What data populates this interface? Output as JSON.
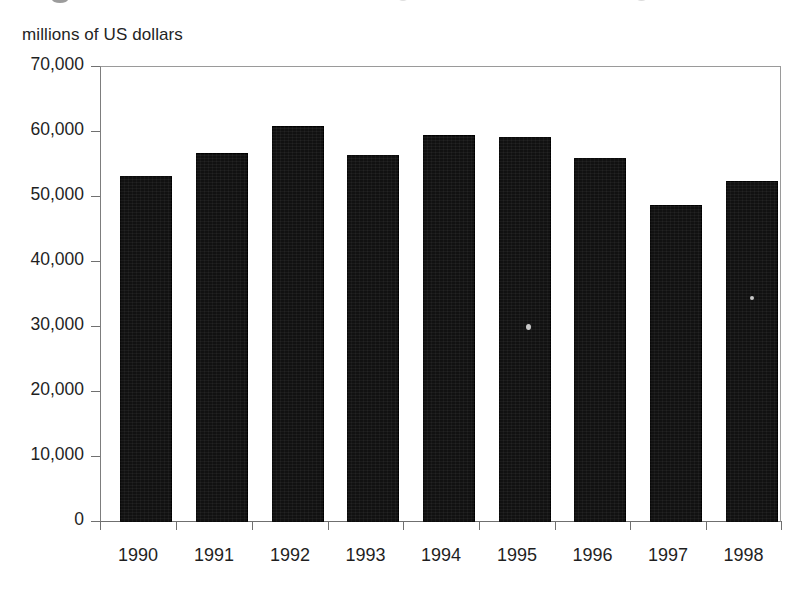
{
  "chart_data": {
    "type": "bar",
    "title": "",
    "subtitle": "",
    "xlabel": "",
    "ylabel": "millions of US dollars",
    "categories": [
      "1990",
      "1991",
      "1992",
      "1993",
      "1994",
      "1995",
      "1996",
      "1997",
      "1998"
    ],
    "values": [
      53200,
      56800,
      60900,
      56500,
      59500,
      59200,
      56000,
      48800,
      52500
    ],
    "ylim": [
      0,
      70000
    ],
    "ytick_labels": [
      "70,000",
      "60,000",
      "50,000",
      "40,000",
      "30,000",
      "20,000",
      "10,000",
      "0"
    ],
    "ytick_values": [
      70000,
      60000,
      50000,
      40000,
      30000,
      20000,
      10000,
      0
    ],
    "grid": false,
    "legend": false,
    "legend_position": "none",
    "bar_color": "#111111",
    "axis_color": "#707070",
    "series": [
      {
        "name": "value",
        "values": [
          53200,
          56800,
          60900,
          56500,
          59500,
          59200,
          56000,
          48800,
          52500
        ]
      }
    ]
  },
  "axes": {
    "y_unit_caption": "millions of US dollars"
  }
}
